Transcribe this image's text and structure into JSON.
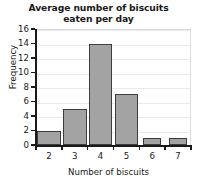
{
  "chart_data": {
    "type": "bar",
    "title": "Average number of biscuits eaten per day",
    "title_line1": "Average number of biscuits",
    "title_line2": "eaten per day",
    "xlabel": "Number of biscuits",
    "ylabel": "Frequency",
    "categories": [
      "2",
      "3",
      "4",
      "5",
      "6",
      "7"
    ],
    "values": [
      2,
      5,
      14,
      7,
      1,
      1
    ],
    "ylim": [
      0,
      16
    ],
    "ytick_step": 2,
    "yticks": [
      "0",
      "2",
      "4",
      "6",
      "8",
      "10",
      "12",
      "14",
      "16"
    ],
    "grid": "horizontal",
    "legend": "none",
    "colors": {
      "bar_fill": "#a3a3a3",
      "bar_border": "#3d3d3d",
      "gridline": "#e9e9e9",
      "axis": "#1a1a1a",
      "plot_background": "#ffffff",
      "text": "#1a1a1a"
    }
  }
}
